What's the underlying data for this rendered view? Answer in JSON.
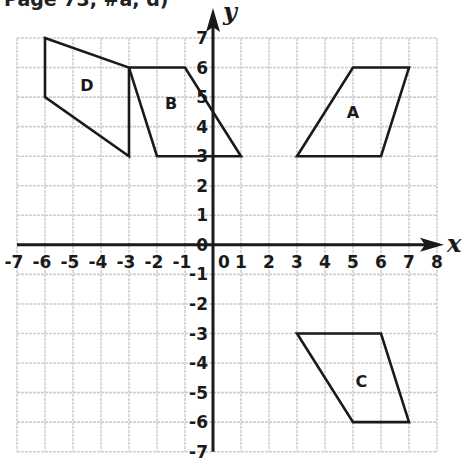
{
  "header": {
    "text": "Page 73, #a, d)"
  },
  "chart_data": {
    "type": "coordinate-plane",
    "title": "",
    "xlabel": "x",
    "ylabel": "y",
    "xlim": [
      -7,
      8
    ],
    "ylim": [
      -7,
      7
    ],
    "grid": true,
    "x_ticks": [
      -7,
      -6,
      -5,
      -4,
      -3,
      -2,
      -1,
      0,
      1,
      2,
      3,
      4,
      5,
      6,
      7,
      8
    ],
    "y_ticks": [
      7,
      6,
      5,
      4,
      3,
      2,
      1,
      0,
      -1,
      -2,
      -3,
      -4,
      -5,
      -6,
      -7
    ],
    "shapes": [
      {
        "label": "A",
        "vertices": [
          [
            3,
            3
          ],
          [
            5,
            6
          ],
          [
            7,
            6
          ],
          [
            6,
            3
          ]
        ],
        "label_pos": [
          5,
          4.5
        ]
      },
      {
        "label": "B",
        "vertices": [
          [
            -3,
            6
          ],
          [
            -1,
            6
          ],
          [
            1,
            3
          ],
          [
            -2,
            3
          ]
        ],
        "label_pos": [
          -1.5,
          4.8
        ]
      },
      {
        "label": "C",
        "vertices": [
          [
            3,
            -3
          ],
          [
            6,
            -3
          ],
          [
            7,
            -6
          ],
          [
            5,
            -6
          ]
        ],
        "label_pos": [
          5.3,
          -4.6
        ]
      },
      {
        "label": "D",
        "vertices": [
          [
            -6,
            7
          ],
          [
            -3,
            6
          ],
          [
            -3,
            3
          ],
          [
            -6,
            5
          ]
        ],
        "label_pos": [
          -4.5,
          5.4
        ]
      }
    ]
  },
  "colors": {
    "grid": "#cfcfcf",
    "axis": "#1a1a1a",
    "shape_stroke": "#1a1a1a",
    "background": "#ffffff"
  }
}
